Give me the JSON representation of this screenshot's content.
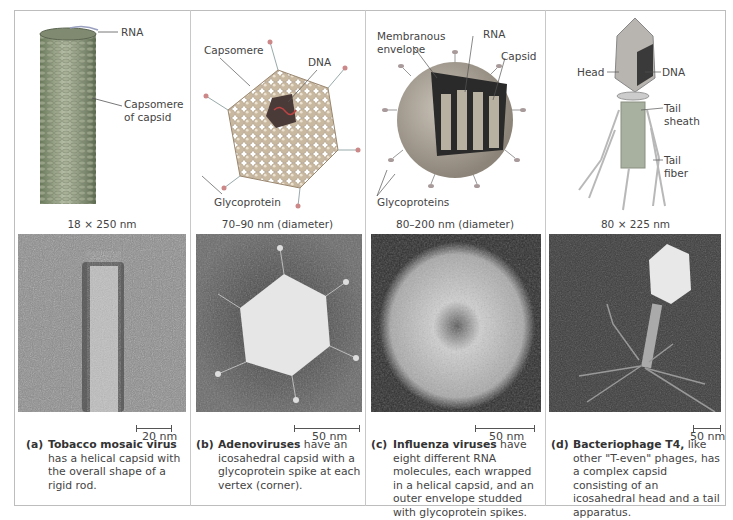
{
  "panels": [
    {
      "id": "a",
      "illustration_labels": {
        "rna": "RNA",
        "capsomere": "Capsomere\nof capsid"
      },
      "dimensions": "18 × 250 nm",
      "scale_bar": "20 nm",
      "caption": {
        "letter": "(a)",
        "title": "Tobacco mosaic virus",
        "text": " has a helical capsid with the overall shape of a rigid rod."
      }
    },
    {
      "id": "b",
      "illustration_labels": {
        "capsomere": "Capsomere",
        "dna": "DNA",
        "glycoprotein": "Glycoprotein"
      },
      "dimensions": "70–90 nm (diameter)",
      "scale_bar": "50 nm",
      "caption": {
        "letter": "(b)",
        "title": "Adenoviruses",
        "text": " have an icosahedral capsid with a glycoprotein spike at each vertex (corner)."
      }
    },
    {
      "id": "c",
      "illustration_labels": {
        "envelope": "Membranous\nenvelope",
        "rna": "RNA",
        "capsid": "Capsid",
        "glycoproteins": "Glycoproteins"
      },
      "dimensions": "80–200 nm (diameter)",
      "scale_bar": "50 nm",
      "caption": {
        "letter": "(c)",
        "title": "Influenza viruses",
        "text": " have eight different RNA molecules, each wrapped in a helical capsid, and an outer envelope studded with glycoprotein spikes."
      }
    },
    {
      "id": "d",
      "illustration_labels": {
        "head": "Head",
        "dna": "DNA",
        "tail_sheath": "Tail\nsheath",
        "tail_fiber": "Tail\nfiber"
      },
      "dimensions": "80 × 225 nm",
      "scale_bar": "50 nm",
      "caption": {
        "letter": "(d)",
        "title": "Bacteriophage T4,",
        "text": " like other \"T-even\" phages, has a complex capsid consisting of an icosahedral head and a tail apparatus."
      }
    }
  ]
}
